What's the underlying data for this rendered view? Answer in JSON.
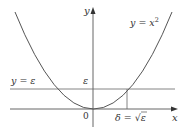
{
  "figure": {
    "axes": {
      "x_label": "x",
      "y_label": "y",
      "origin_label": "0"
    },
    "curve": {
      "label": "y = x",
      "exponent": "2"
    },
    "horizontal_line": {
      "label": "y = ε"
    },
    "epsilon_tick_label": "ε",
    "delta_label": "δ = ",
    "delta_sqrt": "√",
    "delta_radicand": "ε"
  },
  "colors": {
    "stroke": "#555555",
    "text": "#333333",
    "background": "#ffffff"
  }
}
